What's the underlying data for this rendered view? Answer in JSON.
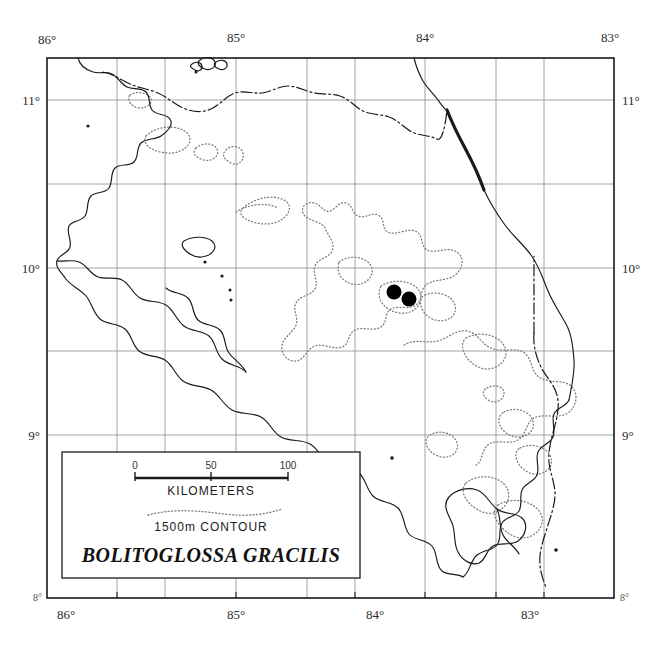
{
  "figure": {
    "kind": "distribution-map",
    "region": "Costa Rica",
    "background_color": "#ffffff",
    "ink_color": "#1a1a1a"
  },
  "frame": {
    "left": 47,
    "top": 58,
    "right": 614,
    "bottom": 598,
    "border_color": "#1a1a1a"
  },
  "graticule": {
    "grid_color": "#8d8d8d",
    "longitude_ticks": [
      {
        "label": "86°",
        "x": 47
      },
      {
        "label": "85°",
        "x": 236
      },
      {
        "label": "84°",
        "x": 425
      },
      {
        "label": "83°",
        "x": 614
      }
    ],
    "longitude_minor_x": [
      117,
      165,
      307,
      355,
      496,
      544
    ],
    "latitude_ticks": [
      {
        "label": "11°",
        "y": 100
      },
      {
        "label": "10°",
        "y": 268
      },
      {
        "label": "9°",
        "y": 435
      },
      {
        "label": "8°",
        "y": 598
      }
    ],
    "latitude_minor_y": [
      184,
      351
    ],
    "corner_small_labels": {
      "bottom_left": "8°",
      "bottom_right": "8°"
    }
  },
  "legend": {
    "box": {
      "x": 62,
      "y": 452,
      "width": 298,
      "height": 126
    },
    "scale_bar": {
      "labels": [
        "0",
        "50",
        "100"
      ],
      "unit_label": "KILOMETERS",
      "x_start": 135,
      "x_end": 288,
      "y": 478
    },
    "contour_sample_label": "1500m CONTOUR",
    "species_name": "BOLITOGLOSSA GRACILIS"
  },
  "localities": {
    "marker_color": "#000000",
    "marker_radius": 7.5,
    "points": [
      {
        "cx": 394,
        "cy": 292
      },
      {
        "cx": 409,
        "cy": 299
      }
    ]
  },
  "map_features": {
    "coastline_label": "coastline",
    "border_label": "international-border",
    "contour_label": "1500m-contour",
    "contour_style": "dotted",
    "border_style": "dash-dot"
  }
}
